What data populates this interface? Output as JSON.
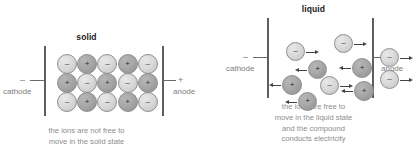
{
  "figure": {
    "panels": [
      {
        "id": "solid",
        "title": "solid",
        "cathode": {
          "sign": "–",
          "label": "cathode"
        },
        "anode": {
          "sign": "+",
          "label": "anode"
        },
        "caption": [
          "the ions are not free to",
          "move in the solid state"
        ],
        "lattice": {
          "rows": 3,
          "cols": 5,
          "charges": [
            [
              "–",
              "+",
              "–",
              "+",
              "–"
            ],
            [
              "+",
              "–",
              "+",
              "–",
              "+"
            ],
            [
              "–",
              "+",
              "–",
              "+",
              "–"
            ]
          ]
        }
      },
      {
        "id": "liquid",
        "title": "liquid",
        "cathode": {
          "sign": "–",
          "label": "cathode"
        },
        "anode": {
          "sign": "+",
          "label": "anode"
        },
        "caption": [
          "the ions are free to",
          "move in the liquid state",
          "and the compound",
          "conducts electricity"
        ],
        "ions": [
          {
            "charge": "–",
            "x": 18,
            "y": 24,
            "d": 19,
            "dir": "right"
          },
          {
            "charge": "–",
            "x": 66,
            "y": 16,
            "d": 19,
            "dir": "right"
          },
          {
            "charge": "–",
            "x": 112,
            "y": 30,
            "d": 19,
            "dir": "right"
          },
          {
            "charge": "+",
            "x": 40,
            "y": 42,
            "d": 19,
            "dir": "left"
          },
          {
            "charge": "+",
            "x": 84,
            "y": 40,
            "d": 20,
            "dir": "left"
          },
          {
            "charge": "–",
            "x": 112,
            "y": 52,
            "d": 19,
            "dir": "right"
          },
          {
            "charge": "+",
            "x": 14,
            "y": 57,
            "d": 20,
            "dir": "left"
          },
          {
            "charge": "–",
            "x": 52,
            "y": 58,
            "d": 19,
            "dir": "right"
          },
          {
            "charge": "+",
            "x": 86,
            "y": 63,
            "d": 20,
            "dir": "left"
          },
          {
            "charge": "+",
            "x": 30,
            "y": 74,
            "d": 19,
            "dir": "left"
          }
        ]
      }
    ]
  },
  "footer": {
    "note": ""
  },
  "colors": {
    "negative_ion": "#dadada",
    "positive_ion": "#a8a8a8",
    "electrode": "#5e5e5e",
    "text": "#8d8d8d",
    "title": "#1a1a1a"
  }
}
